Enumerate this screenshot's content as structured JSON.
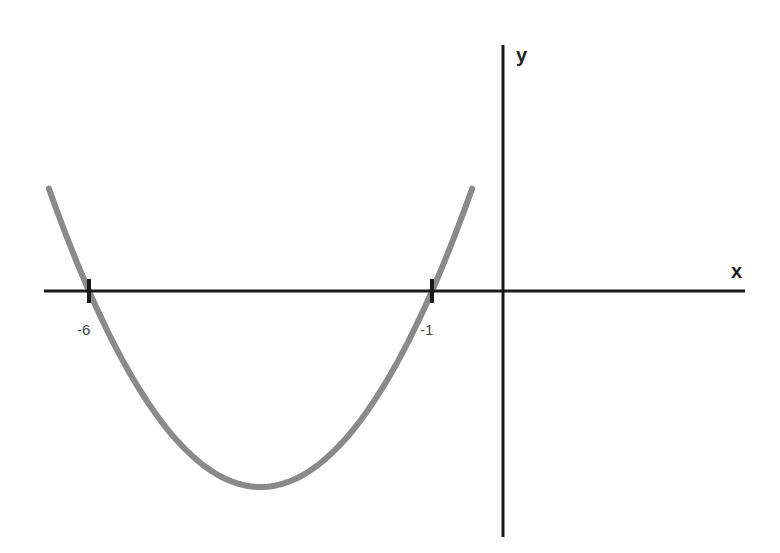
{
  "chart_data": {
    "type": "line",
    "title": "",
    "xlabel": "x",
    "ylabel": "y",
    "function": "y = (x + 1)(x + 6)",
    "roots": [
      -6,
      -1
    ],
    "vertex": {
      "x": -3.5,
      "y": -6.25
    },
    "tick_labels": [
      "-6",
      "-1"
    ],
    "xlim": [
      -6.6,
      3.5
    ],
    "grid": false,
    "legend": null,
    "series": [
      {
        "name": "parabola",
        "color": "#8a8a8a",
        "x": [
          -6.6,
          -6,
          -5,
          -4,
          -3.5,
          -3,
          -2,
          -1,
          -0.4
        ],
        "values": [
          3.36,
          0,
          -4,
          -6,
          -6.25,
          -6,
          -4,
          0,
          3.36
        ]
      }
    ]
  },
  "colors": {
    "axis": "#1a1a1a",
    "curve": "#8a8a8a",
    "background": "#ffffff"
  }
}
